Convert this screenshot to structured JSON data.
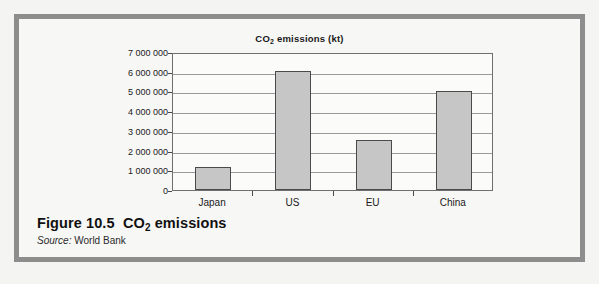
{
  "figure": {
    "caption_prefix": "Figure 10.5",
    "caption_title_pre": "CO",
    "caption_title_sub": "2",
    "caption_title_post": " emissions",
    "source_label": "Source:",
    "source_value": "World Bank",
    "frame_color": "#8d8d8d",
    "page_background": "#f2f2f0"
  },
  "chart_data": {
    "type": "bar",
    "title": "CO2 emissions (kt)",
    "title_pre": "CO",
    "title_sub": "2",
    "title_post": " emissions (kt)",
    "categories": [
      "Japan",
      "US",
      "EU",
      "China"
    ],
    "values": [
      1170000,
      6050000,
      2550000,
      5020000
    ],
    "xlabel": "",
    "ylabel": "",
    "ylim": [
      0,
      7000000
    ],
    "ytick_values": [
      7000000,
      6000000,
      5000000,
      4000000,
      3000000,
      2000000,
      1000000,
      0
    ],
    "ytick_labels": [
      "7 000 000",
      "6 000 000",
      "5 000 000",
      "4 000 000",
      "3 000 000",
      "2 000 000",
      "1 000 000",
      "0"
    ],
    "grid": true,
    "legend": false,
    "bar_fill_color": "#c6c6c6",
    "bar_border_color": "#4a4a4a",
    "plot_background": "#fbfbfa",
    "gridline_color": "#9a9a9a"
  }
}
